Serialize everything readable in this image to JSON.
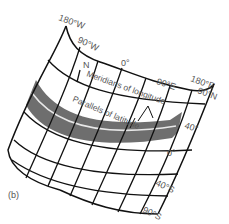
{
  "figure": {
    "panel_label": "(b)",
    "colors": {
      "background": "#ffffff",
      "grid_lines": "#111111",
      "equator_band": "#6e6e6e",
      "equator_line": "#e8e8e8",
      "label_text": "#555555"
    },
    "longitude_labels": {
      "west_edge": "180°W",
      "west_mid": "90°W",
      "center": "0°",
      "east_mid": "90°E",
      "east_edge": "180°E"
    },
    "latitude_labels": {
      "north_pole": "90°N",
      "north": "40°",
      "equator": "0°",
      "south": "40°S",
      "south_pole": "90°S"
    },
    "north_marker": "N",
    "annotations": {
      "meridians": "Meridians of longitude",
      "parallels": "Parallels of latitude"
    }
  }
}
